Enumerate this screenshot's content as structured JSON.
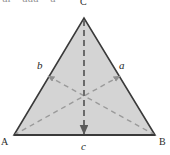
{
  "figure": {
    "kind": "geometry-diagram",
    "shape": "triangle",
    "canvas": {
      "width": 170,
      "height": 155
    },
    "colors": {
      "fill": "#d4d4d4",
      "outline": "#3a3a3a",
      "dashed": "#9a9a9a",
      "label": "#1f1f1f",
      "background": "#ffffff"
    },
    "vertices": [
      {
        "name": "A",
        "label": "A",
        "x": 14,
        "y": 135
      },
      {
        "name": "B",
        "label": "B",
        "x": 155,
        "y": 135
      },
      {
        "name": "C",
        "label": "C",
        "x": 84,
        "y": 18
      }
    ],
    "centroid": {
      "x": 84,
      "y": 96
    },
    "cevians": [
      {
        "name": "cevian-a",
        "label": "a",
        "from_x": 14,
        "from_y": 135,
        "to_x": 119,
        "to_y": 77,
        "arrow": "end"
      },
      {
        "name": "cevian-b",
        "label": "b",
        "from_x": 155,
        "from_y": 135,
        "to_x": 49,
        "to_y": 77,
        "arrow": "end"
      },
      {
        "name": "cevian-c",
        "label": "c",
        "from_x": 84,
        "from_y": 18,
        "to_x": 84,
        "to_y": 135,
        "arrow": "end"
      }
    ],
    "top_crop_fragments": [
      "ui",
      "uuu",
      "u"
    ]
  }
}
